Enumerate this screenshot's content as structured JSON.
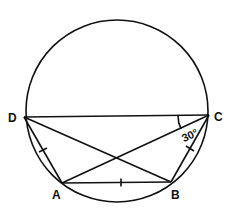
{
  "diagram": {
    "type": "cyclic-quadrilateral",
    "circle": {
      "cx": 117,
      "cy": 111,
      "r": 91
    },
    "points": {
      "D": {
        "label": "D",
        "x": 24,
        "y": 117
      },
      "C": {
        "label": "C",
        "x": 209,
        "y": 115
      },
      "A": {
        "label": "A",
        "x": 62,
        "y": 183
      },
      "B": {
        "label": "B",
        "x": 171,
        "y": 182
      }
    },
    "segments": [
      "DC",
      "DA",
      "AB",
      "BC",
      "DB",
      "AC"
    ],
    "equal_marks": [
      "DA",
      "AB",
      "BC"
    ],
    "angle": {
      "vertex": "C",
      "between": [
        "CD",
        "CA"
      ],
      "label": "30°"
    },
    "stroke_color": "#111111"
  }
}
